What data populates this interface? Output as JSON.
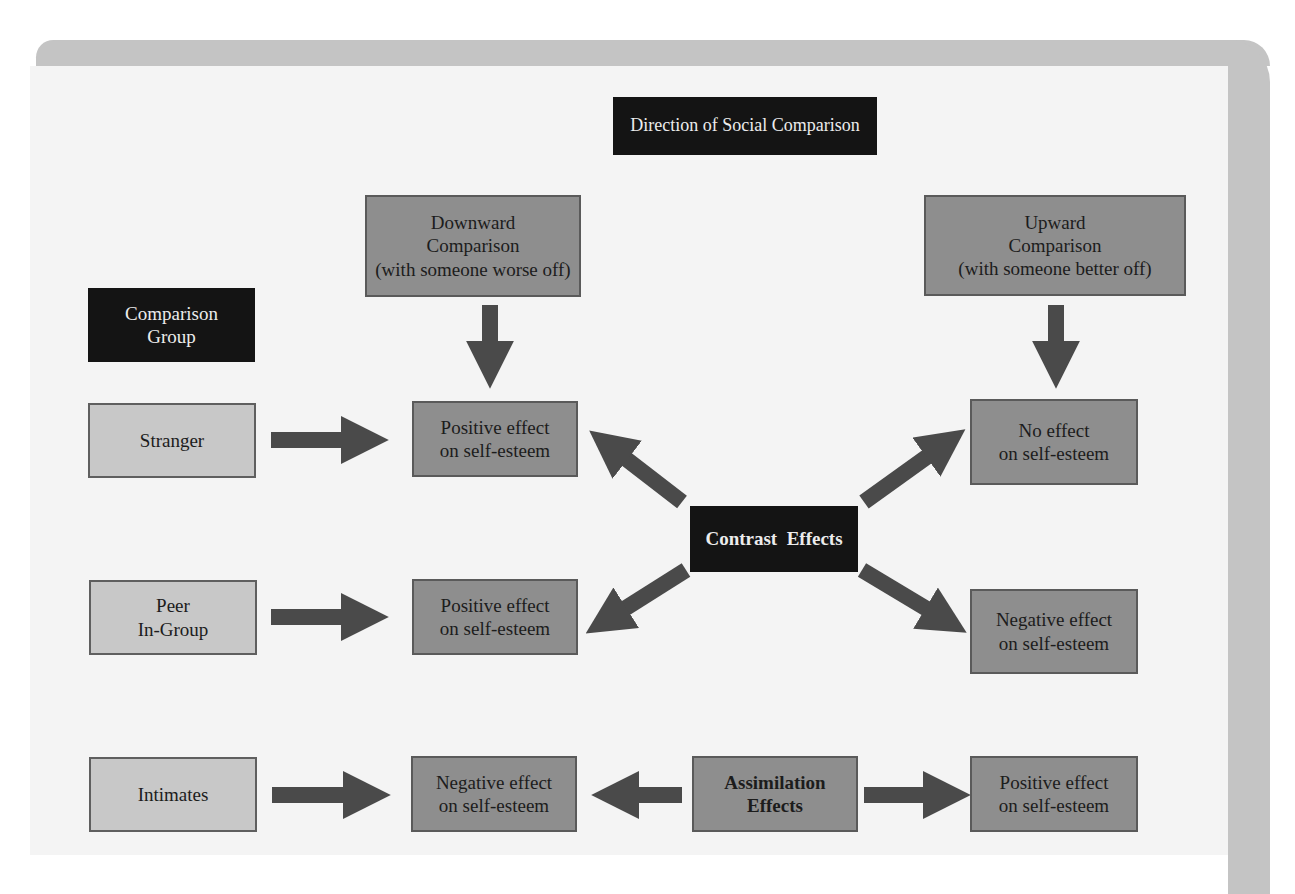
{
  "diagram": {
    "header": {
      "direction_title": "Direction of Social Comparison",
      "comparison_group_title": [
        "Comparison",
        "Group"
      ]
    },
    "directions": [
      {
        "id": "downward",
        "lines": [
          "Downward",
          "Comparison",
          "(with someone worse off)"
        ]
      },
      {
        "id": "upward",
        "lines": [
          "Upward",
          "Comparison",
          "(with someone better off)"
        ]
      }
    ],
    "comparison_groups": [
      {
        "id": "stranger",
        "lines": [
          "Stranger"
        ]
      },
      {
        "id": "peer",
        "lines": [
          "Peer",
          "In-Group"
        ]
      },
      {
        "id": "intimates",
        "lines": [
          "Intimates"
        ]
      }
    ],
    "effects": {
      "stranger_downward": [
        "Positive effect",
        "on self-esteem"
      ],
      "stranger_upward": [
        "No effect",
        "on self-esteem"
      ],
      "peer_downward": [
        "Positive effect",
        "on self-esteem"
      ],
      "peer_upward": [
        "Negative effect",
        "on self-esteem"
      ],
      "intimates_downward": [
        "Negative effect",
        "on self-esteem"
      ],
      "intimates_upward": [
        "Positive effect",
        "on self-esteem"
      ]
    },
    "mechanisms": {
      "contrast": "Contrast  Effects",
      "assimilation": [
        "Assimilation",
        "Effects"
      ]
    },
    "colors": {
      "dark_box": "#141414",
      "medium_box": "#8e8e8e",
      "light_box": "#c8c8c8",
      "arrow": "#4a4a4a",
      "frame": "#c4c4c4",
      "panel": "#f4f4f4"
    }
  }
}
